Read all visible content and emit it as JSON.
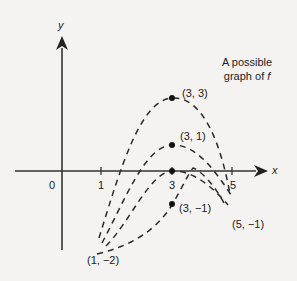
{
  "diagram": {
    "axes": {
      "x_label": "x",
      "y_label": "y",
      "origin_label": "0",
      "x_ticks": [
        "1",
        "3",
        "5"
      ]
    },
    "caption": {
      "line1": "A possible",
      "line2_prefix": "graph of ",
      "line2_var": "f"
    },
    "points": [
      {
        "label": "(3, 3)",
        "x": 3,
        "y": 3,
        "marked": true
      },
      {
        "label": "(3, 1)",
        "x": 3,
        "y": 1,
        "marked": true
      },
      {
        "label": "(3, 0)",
        "x": 3,
        "y": 0,
        "marked": true
      },
      {
        "label": "(3, −1)",
        "x": 3,
        "y": -1,
        "marked": true
      },
      {
        "label": "(1, −2)",
        "x": 1,
        "y": -2,
        "marked": false
      },
      {
        "label": "(5, −1)",
        "x": 5,
        "y": -1,
        "marked": false
      }
    ],
    "curves": [
      {
        "name": "curve-through-3-3",
        "from": "(1, -2)",
        "peak": "(3, 3)",
        "to": "(5, -1)",
        "style": "dashed"
      },
      {
        "name": "curve-through-3-1",
        "from": "(1, -2)",
        "peak": "(3, 1)",
        "to": "(5, -1)",
        "style": "dashed"
      },
      {
        "name": "curve-through-3-0",
        "from": "(1, -2)",
        "peak": "(3, 0)",
        "to": "(5, -1)",
        "style": "dashed"
      },
      {
        "name": "curve-through-3-neg1",
        "from": "(1, -2)",
        "peak": "(3, -1)",
        "to": "(5, -1)",
        "style": "dashed"
      }
    ],
    "colors": {
      "ink": "#222222",
      "background": "#f4f3f1"
    }
  }
}
